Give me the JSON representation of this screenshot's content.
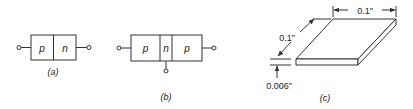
{
  "figures": {
    "a": {
      "caption": "(a)",
      "regions": [
        "p",
        "n"
      ]
    },
    "b": {
      "caption": "(b)",
      "regions": [
        "p",
        "n",
        "p"
      ]
    },
    "c": {
      "caption": "(c)",
      "dim_width": "0.1″",
      "dim_depth": "0.1″",
      "dim_thickness": "0.006″"
    }
  },
  "colors": {
    "line": "#333333",
    "background": "#ffffff"
  }
}
